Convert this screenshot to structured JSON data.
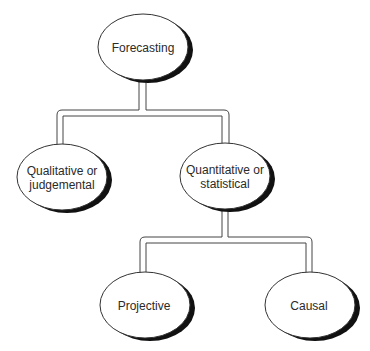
{
  "diagram": {
    "type": "tree",
    "nodes": [
      {
        "id": "forecasting",
        "lines": [
          "Forecasting"
        ]
      },
      {
        "id": "qualitative",
        "lines": [
          "Qualitative or",
          "judgemental"
        ]
      },
      {
        "id": "quantitative",
        "lines": [
          "Quantitative or",
          "statistical"
        ]
      },
      {
        "id": "projective",
        "lines": [
          "Projective"
        ]
      },
      {
        "id": "causal",
        "lines": [
          "Causal"
        ]
      }
    ],
    "edges": [
      {
        "from": "forecasting",
        "to": "qualitative"
      },
      {
        "from": "forecasting",
        "to": "quantitative"
      },
      {
        "from": "quantitative",
        "to": "projective"
      },
      {
        "from": "quantitative",
        "to": "causal"
      }
    ]
  },
  "colors": {
    "stroke": "#333333",
    "shadow": "#111111",
    "fill": "#ffffff"
  }
}
